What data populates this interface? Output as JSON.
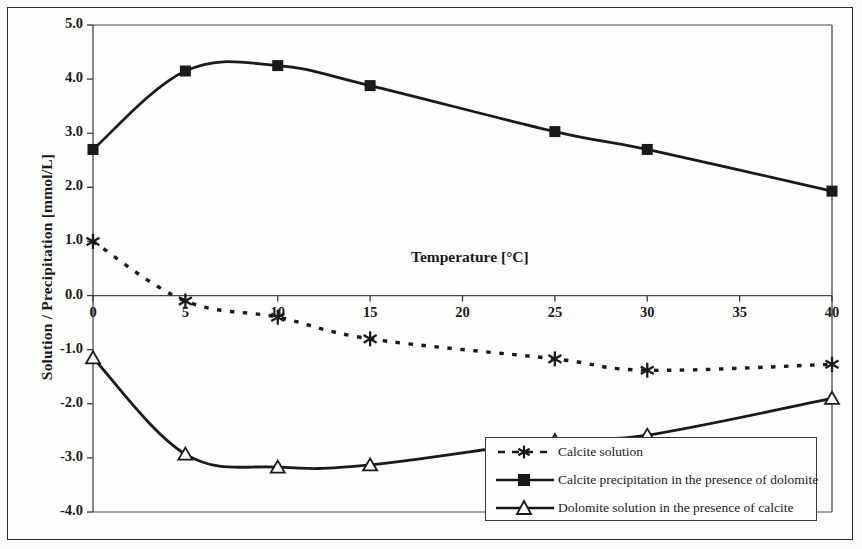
{
  "chart_data": {
    "type": "line",
    "title": "",
    "xlabel": "Temperature [°C]",
    "ylabel": "Solution / Precipitation [mmol/L]",
    "x": [
      0,
      5,
      10,
      15,
      25,
      30,
      40
    ],
    "xlim": [
      0,
      40
    ],
    "ylim": [
      -4.0,
      5.0
    ],
    "xticks": [
      "0",
      "5",
      "10",
      "15",
      "20",
      "25",
      "30",
      "35",
      "40"
    ],
    "xtick_values": [
      0,
      5,
      10,
      15,
      20,
      25,
      30,
      35,
      40
    ],
    "yticks": [
      "5.0",
      "4.0",
      "3.0",
      "2.0",
      "1.0",
      "0.0",
      "-1.0",
      "-2.0",
      "-3.0",
      "-4.0"
    ],
    "ytick_values": [
      5.0,
      4.0,
      3.0,
      2.0,
      1.0,
      0.0,
      -1.0,
      -2.0,
      -3.0,
      -4.0
    ],
    "grid": false,
    "legend_position": "bottom-right",
    "series": [
      {
        "name": "Calcite solution",
        "marker": "asterisk",
        "line_style": "dashed",
        "color": "#1a1a1a",
        "values": [
          1.0,
          -0.1,
          -0.4,
          -0.8,
          -1.17,
          -1.38,
          -1.27
        ]
      },
      {
        "name": "Calcite precipitation in the presence of dolomite",
        "marker": "filled-square",
        "line_style": "solid",
        "color": "#1a1a1a",
        "values": [
          2.7,
          4.15,
          4.25,
          3.88,
          3.03,
          2.7,
          1.93
        ]
      },
      {
        "name": "Dolomite solution in the presence of calcite",
        "marker": "open-triangle",
        "line_style": "solid",
        "color": "#1a1a1a",
        "values": [
          -1.15,
          -2.93,
          -3.17,
          -3.13,
          -2.68,
          -2.58,
          -1.9
        ]
      }
    ]
  },
  "axes": {
    "x_title": "Temperature [°C]",
    "y_title": "Solution / Precipitation [mmol/L]"
  },
  "legend": {
    "entries": [
      "Calcite solution",
      "Calcite precipitation in the presence of dolomite",
      "Dolomite solution in the presence of calcite"
    ]
  }
}
